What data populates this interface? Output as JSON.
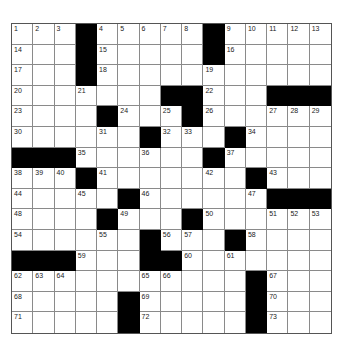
{
  "puzzle": {
    "rows": 15,
    "cols": 15,
    "colors": {
      "black": "#000000",
      "white": "#ffffff",
      "line": "#8a8a8a"
    },
    "grid": [
      [
        "1",
        "2",
        "3",
        "#",
        "4",
        "5",
        "6",
        "7",
        "8",
        "#",
        "9",
        "10",
        "11",
        "12",
        "13"
      ],
      [
        "14",
        "",
        "",
        "#",
        "15",
        "",
        "",
        "",
        "",
        "#",
        "16",
        "",
        "",
        "",
        ""
      ],
      [
        "17",
        "",
        "",
        "#",
        "18",
        "",
        "",
        "",
        "",
        "19",
        "",
        "",
        "",
        "",
        ""
      ],
      [
        "20",
        "",
        "",
        "21",
        "",
        "",
        "",
        "#",
        "#",
        "22",
        "",
        "",
        "#",
        "#",
        "#"
      ],
      [
        "23",
        "",
        "",
        "",
        "#",
        "24",
        "",
        "25",
        "#",
        "26",
        "",
        "",
        "27",
        "28",
        "29"
      ],
      [
        "30",
        "",
        "",
        "",
        "31",
        "",
        "#",
        "32",
        "33",
        "",
        "#",
        "34",
        "",
        "",
        ""
      ],
      [
        "#",
        "#",
        "#",
        "35",
        "",
        "",
        "36",
        "",
        "",
        "#",
        "37",
        "",
        "",
        "",
        ""
      ],
      [
        "38",
        "39",
        "40",
        "#",
        "41",
        "",
        "",
        "",
        "",
        "42",
        "",
        "#",
        "43",
        "",
        ""
      ],
      [
        "44",
        "",
        "",
        "45",
        "",
        "#",
        "46",
        "",
        "",
        "",
        "",
        "47",
        "#",
        "#",
        "#"
      ],
      [
        "48",
        "",
        "",
        "",
        "#",
        "49",
        "",
        "",
        "#",
        "50",
        "",
        "",
        "51",
        "52",
        "53"
      ],
      [
        "54",
        "",
        "",
        "",
        "55",
        "",
        "#",
        "56",
        "57",
        "",
        "#",
        "58",
        "",
        "",
        ""
      ],
      [
        "#",
        "#",
        "#",
        "59",
        "",
        "",
        "#",
        "#",
        "60",
        "",
        "61",
        "",
        "",
        "",
        ""
      ],
      [
        "62",
        "63",
        "64",
        "",
        "",
        "",
        "65",
        "66",
        "",
        "",
        "",
        "#",
        "67",
        "",
        ""
      ],
      [
        "68",
        "",
        "",
        "",
        "",
        "#",
        "69",
        "",
        "",
        "",
        "",
        "#",
        "70",
        "",
        ""
      ],
      [
        "71",
        "",
        "",
        "",
        "",
        "#",
        "72",
        "",
        "",
        "",
        "",
        "#",
        "73",
        "",
        ""
      ]
    ]
  }
}
